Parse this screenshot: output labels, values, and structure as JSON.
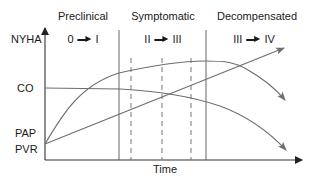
{
  "diagram": {
    "phases": [
      {
        "label": "Preclinical",
        "nyha_from": "0",
        "nyha_to": "I"
      },
      {
        "label": "Symptomatic",
        "nyha_from": "II",
        "nyha_to": "III"
      },
      {
        "label": "Decompensated",
        "nyha_from": "III",
        "nyha_to": "IV"
      }
    ],
    "y_labels": {
      "nyha": "NYHA",
      "co": "CO",
      "pap": "PAP",
      "pvr": "PVR"
    },
    "x_label": "Time",
    "colors": {
      "axis": "#333333",
      "curve": "#6e6e6e",
      "text": "#1a1a1a"
    }
  }
}
